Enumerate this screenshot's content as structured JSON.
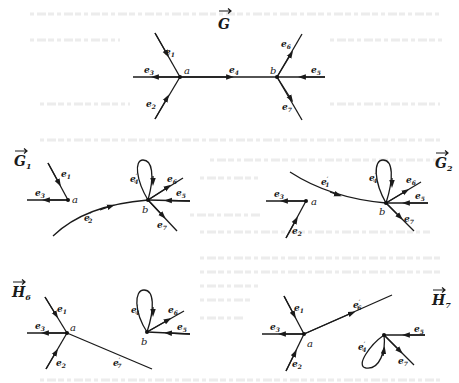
{
  "figure": {
    "panels": [
      {
        "id": "G",
        "title": "G",
        "title_subscript": "",
        "vertices": [
          {
            "name": "a"
          },
          {
            "name": "b"
          }
        ],
        "edges": [
          {
            "label": "e",
            "sub": "1",
            "prime": false,
            "from": "outside",
            "to": "a"
          },
          {
            "label": "e",
            "sub": "2",
            "prime": false,
            "from": "outside",
            "to": "a"
          },
          {
            "label": "e",
            "sub": "3",
            "prime": false,
            "from": "a",
            "to": "outside"
          },
          {
            "label": "e",
            "sub": "4",
            "prime": false,
            "from": "a",
            "to": "b"
          },
          {
            "label": "e",
            "sub": "5",
            "prime": false,
            "from": "outside",
            "to": "b"
          },
          {
            "label": "e",
            "sub": "6",
            "prime": false,
            "from": "b",
            "to": "outside"
          },
          {
            "label": "e",
            "sub": "7",
            "prime": false,
            "from": "b",
            "to": "outside"
          }
        ]
      },
      {
        "id": "G1",
        "title": "G",
        "title_subscript": "1",
        "vertices": [
          {
            "name": "a"
          },
          {
            "name": "b"
          }
        ],
        "edges": [
          {
            "label": "e",
            "sub": "1",
            "prime": false,
            "from": "outside",
            "to": "a"
          },
          {
            "label": "e",
            "sub": "3",
            "prime": false,
            "from": "a",
            "to": "outside"
          },
          {
            "label": "e",
            "sub": "2",
            "prime": true,
            "from": "outside",
            "to": "b"
          },
          {
            "label": "e",
            "sub": "4",
            "prime": true,
            "from": "b",
            "to": "b"
          },
          {
            "label": "e",
            "sub": "5",
            "prime": false,
            "from": "outside",
            "to": "b"
          },
          {
            "label": "e",
            "sub": "6",
            "prime": false,
            "from": "b",
            "to": "outside"
          },
          {
            "label": "e",
            "sub": "7",
            "prime": false,
            "from": "b",
            "to": "outside"
          }
        ]
      },
      {
        "id": "G2",
        "title": "G",
        "title_subscript": "2",
        "vertices": [
          {
            "name": "a"
          },
          {
            "name": "b"
          }
        ],
        "edges": [
          {
            "label": "e",
            "sub": "1",
            "prime": true,
            "from": "outside",
            "to": "b"
          },
          {
            "label": "e",
            "sub": "2",
            "prime": false,
            "from": "outside",
            "to": "a"
          },
          {
            "label": "e",
            "sub": "3",
            "prime": false,
            "from": "a",
            "to": "outside"
          },
          {
            "label": "e",
            "sub": "4",
            "prime": true,
            "from": "b",
            "to": "b"
          },
          {
            "label": "e",
            "sub": "5",
            "prime": false,
            "from": "outside",
            "to": "b"
          },
          {
            "label": "e",
            "sub": "6",
            "prime": false,
            "from": "b",
            "to": "outside"
          },
          {
            "label": "e",
            "sub": "7",
            "prime": false,
            "from": "b",
            "to": "outside"
          }
        ]
      },
      {
        "id": "H6",
        "title": "H",
        "title_subscript": "6",
        "vertices": [
          {
            "name": "a"
          },
          {
            "name": "b"
          }
        ],
        "edges": [
          {
            "label": "e",
            "sub": "1",
            "prime": false,
            "from": "outside",
            "to": "a"
          },
          {
            "label": "e",
            "sub": "2",
            "prime": false,
            "from": "outside",
            "to": "a"
          },
          {
            "label": "e",
            "sub": "3",
            "prime": false,
            "from": "a",
            "to": "outside"
          },
          {
            "label": "e",
            "sub": "7",
            "prime": true,
            "from": "a",
            "to": "outside"
          },
          {
            "label": "e",
            "sub": "4",
            "prime": true,
            "from": "b",
            "to": "b"
          },
          {
            "label": "e",
            "sub": "5",
            "prime": false,
            "from": "outside",
            "to": "b"
          },
          {
            "label": "e",
            "sub": "6",
            "prime": false,
            "from": "b",
            "to": "outside"
          }
        ]
      },
      {
        "id": "H7",
        "title": "H",
        "title_subscript": "7",
        "vertices": [
          {
            "name": "a"
          },
          {
            "name": ""
          }
        ],
        "edges": [
          {
            "label": "e",
            "sub": "1",
            "prime": false,
            "from": "outside",
            "to": "a"
          },
          {
            "label": "e",
            "sub": "2",
            "prime": false,
            "from": "outside",
            "to": "a"
          },
          {
            "label": "e",
            "sub": "3",
            "prime": false,
            "from": "a",
            "to": "outside"
          },
          {
            "label": "e",
            "sub": "6",
            "prime": true,
            "from": "a",
            "to": "outside"
          },
          {
            "label": "e",
            "sub": "4",
            "prime": true,
            "from": "b",
            "to": "b"
          },
          {
            "label": "e",
            "sub": "5",
            "prime": false,
            "from": "outside",
            "to": "b"
          },
          {
            "label": "e",
            "sub": "7",
            "prime": false,
            "from": "b",
            "to": "outside"
          }
        ]
      }
    ],
    "labels": {
      "G_title": "G",
      "G1_title": "G",
      "G1_sub": "1",
      "G2_title": "G",
      "G2_sub": "2",
      "H6_title": "H",
      "H6_sub": "6",
      "H7_title": "H",
      "H7_sub": "7",
      "vertex_a": "a",
      "vertex_b": "b",
      "e": "e",
      "prime": "′",
      "s1": "1",
      "s2": "2",
      "s3": "3",
      "s4": "4",
      "s5": "5",
      "s6": "6",
      "s7": "7"
    },
    "colors": {
      "ink": "#1a1a1a",
      "paper": "#ffffff",
      "bleed_through": "#ececec"
    }
  }
}
